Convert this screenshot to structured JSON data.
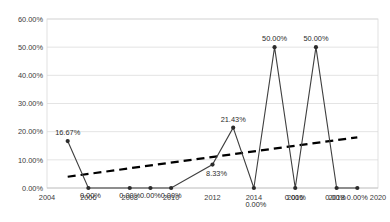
{
  "chart_data": {
    "type": "line",
    "title": "",
    "xlabel": "",
    "ylabel": "",
    "x": [
      2005,
      2006,
      2008,
      2009,
      2010,
      2012,
      2013,
      2014,
      2015,
      2016,
      2017,
      2018,
      2019
    ],
    "values": [
      16.67,
      0.0,
      0.0,
      0.0,
      0.0,
      8.33,
      21.43,
      0.0,
      50.0,
      0.0,
      50.0,
      0.0,
      0.0
    ],
    "data_labels": [
      "16.67%",
      "0.00%",
      "0.00%",
      "0.00%",
      "0.00%",
      "8.33%",
      "21.43%",
      "0.00%",
      "50.00%",
      "0.00%",
      "50.00%",
      "0.00%",
      "0.00%"
    ],
    "xlim": [
      2004,
      2020
    ],
    "ylim": [
      0,
      60
    ],
    "ytick_labels": [
      "0.00%",
      "10.00%",
      "20.00%",
      "30.00%",
      "40.00%",
      "50.00%",
      "60.00%"
    ],
    "ytick_values": [
      0,
      10,
      20,
      30,
      40,
      50,
      60
    ],
    "xtick_labels": [
      "2004",
      "2006",
      "2008",
      "2010",
      "2012",
      "2014",
      "2016",
      "2018",
      "2020"
    ],
    "xtick_values": [
      2004,
      2006,
      2008,
      2010,
      2012,
      2014,
      2016,
      2018,
      2020
    ],
    "grid": true,
    "legend": "none",
    "series": [
      {
        "name": "percentage",
        "style": "line-with-markers",
        "color": "#3f3f3f",
        "values": [
          16.67,
          0.0,
          0.0,
          0.0,
          0.0,
          8.33,
          21.43,
          0.0,
          50.0,
          0.0,
          50.0,
          0.0,
          0.0
        ]
      },
      {
        "name": "linear-trendline",
        "style": "dashed",
        "color": "#000000",
        "x_start": 2005,
        "y_start": 4.0,
        "x_end": 2019,
        "y_end": 18.0
      }
    ]
  }
}
